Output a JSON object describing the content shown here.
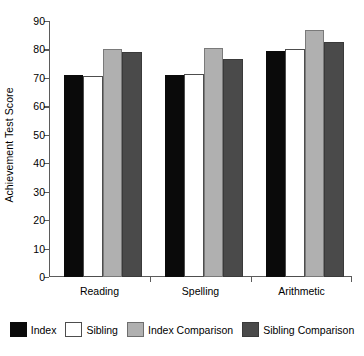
{
  "chart_data": {
    "type": "bar",
    "title": "",
    "xlabel": "",
    "ylabel": "Achievement Test Score",
    "categories": [
      "Reading",
      "Spelling",
      "Arithmetic"
    ],
    "ylim": [
      0,
      90
    ],
    "yticks": [
      0,
      10,
      20,
      30,
      40,
      50,
      60,
      70,
      80,
      90
    ],
    "grid": false,
    "legend_position": "bottom",
    "series": [
      {
        "name": "Index",
        "color": "#0a0a0a",
        "values": [
          71,
          71,
          79.5
        ]
      },
      {
        "name": "Sibling",
        "color": "#ffffff",
        "values": [
          70.5,
          71.5,
          80
        ]
      },
      {
        "name": "Index Comparison",
        "color": "#b0b0b0",
        "values": [
          80,
          80.5,
          87
        ]
      },
      {
        "name": "Sibling Comparison",
        "color": "#4a4a4a",
        "values": [
          79,
          76.5,
          82.5
        ]
      }
    ]
  }
}
